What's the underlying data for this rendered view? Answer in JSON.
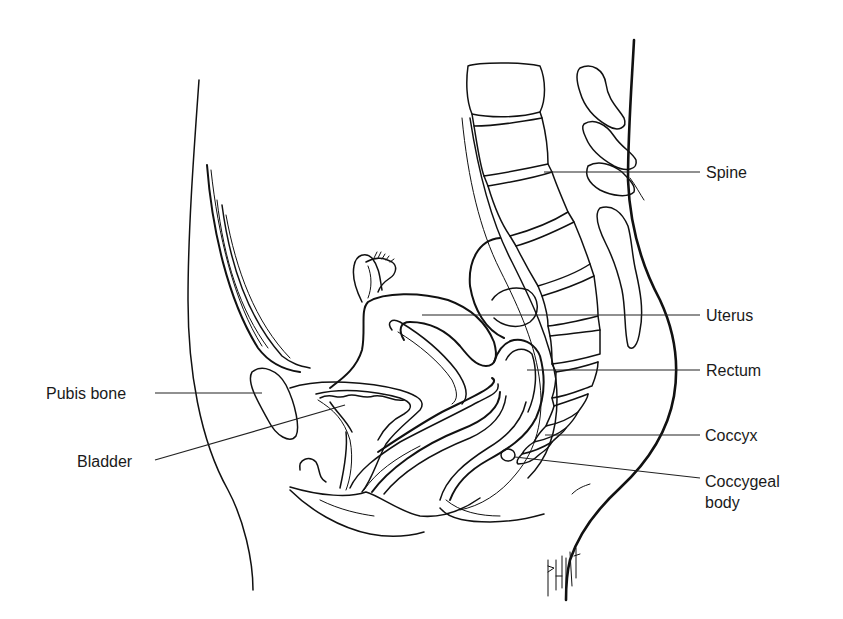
{
  "diagram": {
    "line_color": "#111111",
    "background": "#ffffff",
    "labels": [
      {
        "id": "spine",
        "text": "Spine"
      },
      {
        "id": "uterus",
        "text": "Uterus"
      },
      {
        "id": "rectum",
        "text": "Rectum"
      },
      {
        "id": "coccyx",
        "text": "Coccyx"
      },
      {
        "id": "coccygeal-body",
        "text": "Coccygeal\nbody"
      },
      {
        "id": "pubis-bone",
        "text": "Pubis bone"
      },
      {
        "id": "bladder",
        "text": "Bladder"
      }
    ],
    "artist_signature": "BATTISTA"
  }
}
